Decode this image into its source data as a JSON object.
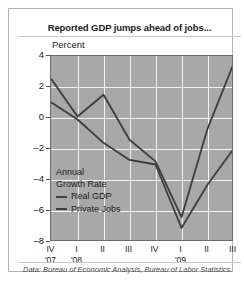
{
  "chart_data": {
    "type": "line",
    "title": "Reported GDP jumps ahead of jobs...",
    "ylabel": "Percent",
    "xlabel": "",
    "legend_title": "Annual Growth Rate",
    "legend_position": "inside-lower-left",
    "grid": true,
    "ylim": [
      -8,
      4
    ],
    "yticks": [
      4,
      2,
      0,
      -2,
      -4,
      -6,
      -8
    ],
    "ytick_labels": [
      "4",
      "2",
      "0",
      "–2",
      "–4",
      "–6",
      "–8"
    ],
    "categories": [
      "IV",
      "I",
      "II",
      "III",
      "IV",
      "I",
      "II",
      "III"
    ],
    "year_labels": [
      {
        "label": "'07",
        "index": 0
      },
      {
        "label": "'08",
        "index": 1
      },
      {
        "label": "'09",
        "index": 5
      }
    ],
    "series": [
      {
        "name": "Real GDP",
        "color": "#3d3d3d",
        "values": [
          2.5,
          0.1,
          1.5,
          -1.4,
          -2.8,
          -6.4,
          -0.7,
          3.5
        ]
      },
      {
        "name": "Private Jobs",
        "color": "#3d3d3d",
        "values": [
          1.0,
          -0.1,
          -1.6,
          -2.7,
          -3.0,
          -7.1,
          -4.3,
          -2.0
        ]
      }
    ],
    "source": "Data: Bureau of Economic Analysis, Bureau of Labor Statistics."
  }
}
